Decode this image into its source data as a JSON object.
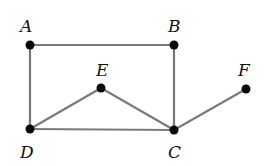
{
  "diagram": {
    "type": "graph",
    "nodes": [
      {
        "id": "A",
        "label": "A",
        "x": 30,
        "y": 45,
        "lx": 20,
        "ly": 32
      },
      {
        "id": "B",
        "label": "B",
        "x": 174,
        "y": 45,
        "lx": 168,
        "ly": 32
      },
      {
        "id": "E",
        "label": "E",
        "x": 101,
        "y": 88,
        "lx": 96,
        "ly": 76
      },
      {
        "id": "F",
        "label": "F",
        "x": 246,
        "y": 89,
        "lx": 238,
        "ly": 76
      },
      {
        "id": "D",
        "label": "D",
        "x": 30,
        "y": 129,
        "lx": 20,
        "ly": 158
      },
      {
        "id": "C",
        "label": "C",
        "x": 174,
        "y": 130,
        "lx": 168,
        "ly": 158
      }
    ],
    "edges": [
      {
        "from": "A",
        "to": "B"
      },
      {
        "from": "A",
        "to": "D"
      },
      {
        "from": "B",
        "to": "C"
      },
      {
        "from": "D",
        "to": "C"
      },
      {
        "from": "D",
        "to": "E"
      },
      {
        "from": "E",
        "to": "C"
      },
      {
        "from": "C",
        "to": "F"
      }
    ],
    "colors": {
      "edge": "#7a7a7a",
      "node": "#0a0a0a",
      "label": "#111111"
    }
  }
}
